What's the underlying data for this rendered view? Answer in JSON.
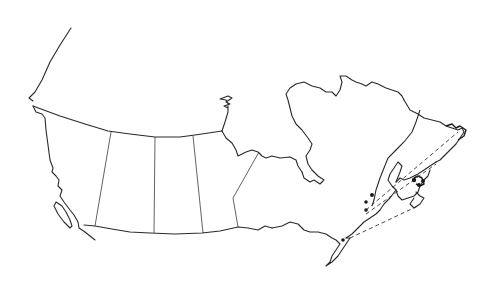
{
  "map": {
    "subject": "Outline map of Canada with provincial boundaries",
    "background_color": "#ffffff",
    "line_color": "#2a2a2a",
    "features": {
      "provincial_borders": [
        "BC-AB",
        "AB-SK",
        "SK-MB",
        "MB-ON"
      ],
      "northern_boundary": "60th parallel line",
      "hudson_bay": "inland bay outline",
      "st_lawren_region": "coastal outlines with dashed corridor lines",
      "markers": "black dots along St. Lawrence / Maritimes"
    },
    "markers": [
      {
        "x": 372,
        "y": 195
      },
      {
        "x": 366,
        "y": 202
      },
      {
        "x": 366,
        "y": 210
      },
      {
        "x": 414,
        "y": 178
      },
      {
        "x": 418,
        "y": 184
      },
      {
        "x": 422,
        "y": 180
      },
      {
        "x": 343,
        "y": 240
      }
    ]
  }
}
